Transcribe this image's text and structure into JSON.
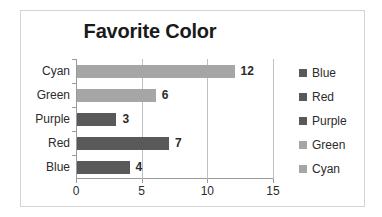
{
  "chart_data": {
    "type": "bar",
    "orientation": "horizontal",
    "title": "Favorite Color",
    "xlabel": "",
    "ylabel": "",
    "categories": [
      "Blue",
      "Red",
      "Purple",
      "Green",
      "Cyan"
    ],
    "values": [
      4,
      7,
      3,
      6,
      12
    ],
    "data_labels": [
      "4",
      "7",
      "3",
      "6",
      "12"
    ],
    "xlim": [
      0,
      15
    ],
    "xticks": [
      0,
      5,
      10,
      15
    ],
    "xtick_labels": [
      "0",
      "5",
      "10",
      "15"
    ],
    "gridlines": "vertical",
    "legend_position": "right",
    "legend": [
      {
        "label": "Blue",
        "color": "#595959"
      },
      {
        "label": "Red",
        "color": "#595959"
      },
      {
        "label": "Purple",
        "color": "#595959"
      },
      {
        "label": "Green",
        "color": "#a6a6a6"
      },
      {
        "label": "Cyan",
        "color": "#a6a6a6"
      }
    ],
    "bar_colors": [
      "#595959",
      "#595959",
      "#595959",
      "#a6a6a6",
      "#a6a6a6"
    ],
    "axis_order_top_to_bottom": [
      "Cyan",
      "Green",
      "Purple",
      "Red",
      "Blue"
    ]
  },
  "colors": {
    "dark_bar": "#595959",
    "light_bar": "#a6a6a6",
    "axis": "#9a9a9a",
    "gridline": "#bfbfbf",
    "frame_border": "#d4d4d4",
    "text": "#2b2b2b",
    "title_text": "#1a1a1a",
    "background": "#ffffff"
  }
}
